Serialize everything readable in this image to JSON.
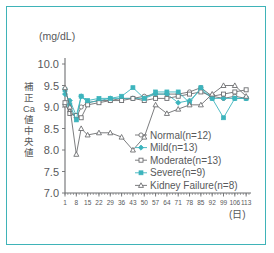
{
  "figure": {
    "border_color": "#3fb3b8",
    "background": "#ffffff",
    "axis_color": "#6d6e71",
    "teal_color": "#3cb4bd"
  },
  "chart_data": {
    "type": "line",
    "title": "",
    "subtitle": "",
    "xlabel": "(日)",
    "ylabel": "補正Ca値中央値",
    "yunit": "(mg/dL)",
    "ylim": [
      7.0,
      10.0
    ],
    "xlim": [
      1,
      116
    ],
    "grid": false,
    "legend_position": "center-right-inside",
    "ytick_labels": [
      "10.0",
      "9.5",
      "9.0",
      "8.5",
      "8.0",
      "7.5",
      "7.0"
    ],
    "ytick_values": [
      10.0,
      9.5,
      9.0,
      8.5,
      8.0,
      7.5,
      7.0
    ],
    "xtick_labels": [
      "1",
      "8",
      "15",
      "22",
      "29",
      "36",
      "43",
      "50",
      "57",
      "64",
      "71",
      "78",
      "85",
      "92",
      "99",
      "106",
      "113"
    ],
    "xtick_values": [
      1,
      8,
      15,
      22,
      29,
      36,
      43,
      50,
      57,
      64,
      71,
      78,
      85,
      92,
      99,
      106,
      113
    ],
    "series": [
      {
        "name": "Normal(n=12)",
        "legend_label": "Normal(n=12)",
        "marker": "open-circle",
        "color": "#6d6e71",
        "x": [
          1,
          4,
          8,
          11,
          15,
          22,
          29,
          36,
          43,
          50,
          57,
          64,
          71,
          78,
          85,
          92,
          99,
          106,
          113
        ],
        "y": [
          9.05,
          8.9,
          8.75,
          9.0,
          9.1,
          9.15,
          9.15,
          9.2,
          9.2,
          9.25,
          9.3,
          9.3,
          9.3,
          9.35,
          9.45,
          9.25,
          9.2,
          9.25,
          9.2
        ]
      },
      {
        "name": "Mild(n=13)",
        "legend_label": "Mild(n=13)",
        "marker": "filled-diamond",
        "color": "#3cb4bd",
        "x": [
          1,
          4,
          8,
          11,
          15,
          22,
          29,
          36,
          43,
          50,
          57,
          64,
          71,
          78,
          85,
          92,
          99,
          106,
          113
        ],
        "y": [
          9.3,
          9.15,
          8.8,
          9.25,
          9.1,
          9.15,
          9.2,
          9.2,
          9.2,
          9.2,
          9.3,
          9.3,
          9.1,
          9.15,
          9.4,
          9.2,
          9.2,
          9.2,
          9.2
        ]
      },
      {
        "name": "Moderate(n=13)",
        "legend_label": "Moderate(n=13)",
        "marker": "open-square",
        "color": "#6d6e71",
        "x": [
          1,
          4,
          8,
          11,
          15,
          22,
          29,
          36,
          43,
          50,
          57,
          64,
          71,
          78,
          85,
          92,
          99,
          106,
          113
        ],
        "y": [
          9.1,
          8.85,
          8.8,
          8.75,
          9.05,
          9.1,
          9.15,
          9.15,
          9.2,
          9.15,
          9.2,
          9.2,
          9.25,
          9.3,
          9.35,
          9.25,
          9.3,
          9.35,
          9.4
        ]
      },
      {
        "name": "Severe(n=9)",
        "legend_label": "Severe(n=9)",
        "marker": "filled-square",
        "color": "#3cb4bd",
        "x": [
          1,
          4,
          8,
          11,
          15,
          22,
          29,
          36,
          43,
          50,
          57,
          64,
          71,
          78,
          85,
          92,
          99,
          106,
          113
        ],
        "y": [
          9.4,
          9.05,
          8.7,
          9.25,
          9.15,
          9.2,
          9.2,
          9.25,
          9.45,
          9.2,
          9.35,
          9.35,
          9.35,
          9.1,
          9.45,
          9.2,
          8.75,
          9.2,
          9.2
        ]
      },
      {
        "name": "Kidney Failure(n=8)",
        "legend_label": "Kidney Failure(n=8)",
        "marker": "open-triangle",
        "color": "#6d6e71",
        "x": [
          1,
          4,
          8,
          11,
          15,
          22,
          29,
          36,
          43,
          50,
          57,
          64,
          71,
          78,
          85,
          92,
          99,
          106,
          113
        ],
        "y": [
          9.45,
          9.0,
          7.9,
          8.5,
          8.35,
          8.4,
          8.4,
          8.3,
          8.0,
          8.3,
          9.05,
          8.85,
          8.95,
          9.05,
          9.05,
          9.3,
          9.5,
          9.5,
          9.25
        ]
      }
    ]
  }
}
